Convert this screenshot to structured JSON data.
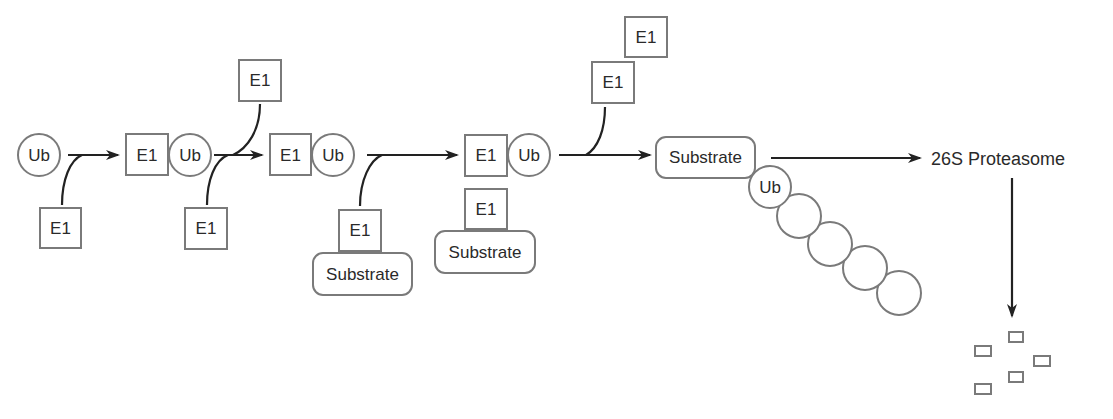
{
  "diagram": {
    "labels": {
      "ub": "Ub",
      "e1": "E1",
      "substrate": "Substrate",
      "proteasome": "26S Proteasome"
    },
    "colors": {
      "shape_stroke": "#7a7a7a",
      "arrow": "#222222",
      "text": "#2a2a2a",
      "background": "#ffffff"
    },
    "steps": [
      {
        "id": 1,
        "nodes": [
          "Ub"
        ],
        "incoming": "E1"
      },
      {
        "id": 2,
        "nodes": [
          "E1",
          "Ub"
        ],
        "incoming": "E1",
        "outgoing": "E1"
      },
      {
        "id": 3,
        "nodes": [
          "E1",
          "Ub"
        ],
        "incoming": [
          "E1",
          "Substrate"
        ]
      },
      {
        "id": 4,
        "nodes": [
          "E1",
          "Ub"
        ],
        "complex_below": [
          "E1",
          "Substrate"
        ],
        "outgoing": [
          "E1",
          "E1"
        ]
      },
      {
        "id": 5,
        "nodes": [
          "Substrate",
          "Ub",
          "chain x4"
        ]
      },
      {
        "id": 6,
        "nodes": [
          "26S Proteasome"
        ],
        "output": "5 peptide fragments"
      }
    ]
  }
}
